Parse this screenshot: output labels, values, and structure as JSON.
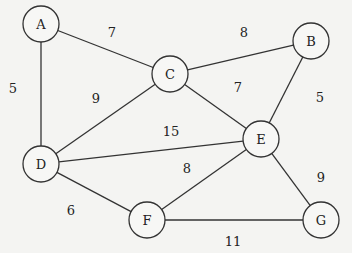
{
  "graph": {
    "nodes": [
      {
        "id": "A",
        "label": "A",
        "x": 41,
        "y": 24
      },
      {
        "id": "B",
        "label": "B",
        "x": 311,
        "y": 41
      },
      {
        "id": "C",
        "label": "C",
        "x": 170,
        "y": 74
      },
      {
        "id": "D",
        "label": "D",
        "x": 41,
        "y": 164
      },
      {
        "id": "E",
        "label": "E",
        "x": 261,
        "y": 139
      },
      {
        "id": "F",
        "label": "F",
        "x": 147,
        "y": 220
      },
      {
        "id": "G",
        "label": "G",
        "x": 321,
        "y": 220
      }
    ],
    "edges": [
      {
        "from": "A",
        "to": "C",
        "weight": "7",
        "lx": 112,
        "ly": 32
      },
      {
        "from": "A",
        "to": "D",
        "weight": "5",
        "lx": 13,
        "ly": 88
      },
      {
        "from": "C",
        "to": "B",
        "weight": "8",
        "lx": 244,
        "ly": 32
      },
      {
        "from": "C",
        "to": "D",
        "weight": "9",
        "lx": 96,
        "ly": 98
      },
      {
        "from": "C",
        "to": "E",
        "weight": "7",
        "lx": 238,
        "ly": 87
      },
      {
        "from": "B",
        "to": "E",
        "weight": "5",
        "lx": 320,
        "ly": 97
      },
      {
        "from": "D",
        "to": "E",
        "weight": "15",
        "lx": 171,
        "ly": 131
      },
      {
        "from": "E",
        "to": "F",
        "weight": "8",
        "lx": 187,
        "ly": 168
      },
      {
        "from": "D",
        "to": "F",
        "weight": "6",
        "lx": 71,
        "ly": 210
      },
      {
        "from": "E",
        "to": "G",
        "weight": "9",
        "lx": 321,
        "ly": 177
      },
      {
        "from": "F",
        "to": "G",
        "weight": "11",
        "lx": 233,
        "ly": 241
      }
    ],
    "node_radius": 18
  }
}
